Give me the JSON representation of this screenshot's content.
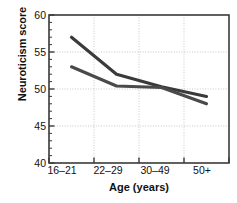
{
  "chart_data": {
    "type": "line",
    "title": "",
    "xlabel": "Age (years)",
    "ylabel": "Neuroticism score",
    "categories": [
      "16–21",
      "22–29",
      "30–49",
      "50+"
    ],
    "ylim": [
      40,
      60
    ],
    "yticks": [
      40,
      45,
      50,
      55,
      60
    ],
    "ytick_labels": [
      "40",
      "45",
      "50",
      "55",
      "60"
    ],
    "grid": true,
    "legend": "none",
    "series": [
      {
        "name": "series-1",
        "values": [
          57.0,
          52.0,
          50.3,
          49.0
        ],
        "color": "#3a3a3a"
      },
      {
        "name": "series-2",
        "values": [
          53.0,
          50.4,
          50.2,
          48.0
        ],
        "color": "#4a4a4a"
      }
    ]
  },
  "axis": {
    "y_tick_0": "40",
    "y_tick_1": "45",
    "y_tick_2": "50",
    "y_tick_3": "55",
    "y_tick_4": "60",
    "x_tick_0": "16–21",
    "x_tick_1": "22–29",
    "x_tick_2": "30–49",
    "x_tick_3": "50+",
    "x_title": "Age (years)",
    "y_title": "Neuroticism score"
  }
}
